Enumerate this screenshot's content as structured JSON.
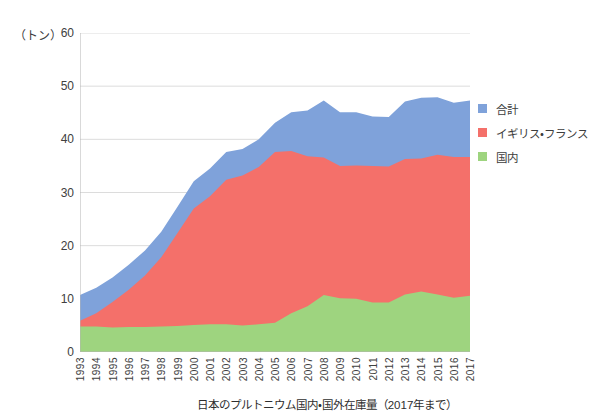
{
  "chart_data": {
    "type": "area",
    "title": "",
    "caption": "日本のプルトニウム国内・国外在庫量（2017年まで）",
    "xlabel": "",
    "ylabel": "（トン）",
    "y_unit_label": "（トン）",
    "ylim": [
      0,
      60
    ],
    "yticks": [
      0,
      10,
      20,
      30,
      40,
      50,
      60
    ],
    "grid": true,
    "grid_axis": "y",
    "legend_position": "right",
    "stacked": true,
    "categories": [
      "1993",
      "1994",
      "1995",
      "1996",
      "1997",
      "1998",
      "1999",
      "2000",
      "2001",
      "2002",
      "2003",
      "2004",
      "2005",
      "2006",
      "2007",
      "2008",
      "2009",
      "2010",
      "2011",
      "2012",
      "2013",
      "2014",
      "2015",
      "2016",
      "2017"
    ],
    "series": [
      {
        "name": "合計",
        "color": "#7fa2da",
        "values": [
          10.7,
          12.1,
          14.0,
          16.4,
          19.1,
          22.6,
          27.3,
          32.1,
          34.5,
          37.6,
          38.2,
          40.0,
          43.1,
          45.1,
          45.4,
          47.3,
          45.1,
          45.1,
          44.3,
          44.2,
          47.1,
          47.8,
          47.9,
          46.9,
          47.3
        ]
      },
      {
        "name": "イギリス・フランス",
        "color": "#f4706a",
        "values": [
          5.9,
          7.3,
          9.4,
          11.7,
          14.4,
          17.8,
          22.4,
          27.0,
          29.3,
          32.4,
          33.2,
          34.8,
          37.6,
          37.8,
          36.8,
          36.6,
          35.0,
          35.1,
          35.0,
          34.9,
          36.3,
          36.4,
          37.1,
          36.7,
          36.7
        ]
      },
      {
        "name": "国内",
        "color": "#9ed47f",
        "values": [
          4.8,
          4.8,
          4.6,
          4.7,
          4.7,
          4.8,
          4.9,
          5.1,
          5.2,
          5.2,
          5.0,
          5.2,
          5.5,
          7.3,
          8.6,
          10.7,
          10.1,
          10.0,
          9.3,
          9.3,
          10.8,
          11.4,
          10.8,
          10.2,
          10.6
        ]
      }
    ]
  },
  "legend": {
    "items": [
      {
        "label": "合計",
        "color": "#7fa2da"
      },
      {
        "label": "イギリス・フランス",
        "color": "#f4706a"
      },
      {
        "label": "国内",
        "color": "#9ed47f"
      }
    ]
  }
}
